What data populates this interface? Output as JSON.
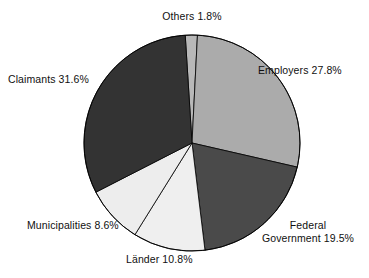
{
  "chart_data": {
    "type": "pie",
    "title": "",
    "subtitle": "",
    "xlabel": "",
    "ylabel": "",
    "legend_position": "none",
    "grid": false,
    "labels": [
      "Others",
      "Employers",
      "Federal Government",
      "Länder",
      "Municipalities",
      "Claimants"
    ],
    "values": [
      1.8,
      27.8,
      19.5,
      10.8,
      8.6,
      31.6
    ],
    "units": "percent",
    "slices": [
      {
        "name": "Others",
        "value": 1.8,
        "value_text": "1.8%",
        "label_text": "Others 1.8%",
        "color": "#b8b8b8",
        "start_angle": -3.6,
        "end_angle": 2.9
      },
      {
        "name": "Employers",
        "value": 27.8,
        "value_text": "27.8%",
        "label_text": "Employers 27.8%",
        "color": "#ababab",
        "start_angle": 2.9,
        "end_angle": 102.9
      },
      {
        "name": "Federal Government",
        "value": 19.5,
        "value_text": "19.5%",
        "label_line1": "Federal",
        "label_line2": "Government 19.5%",
        "color": "#4a4a4a",
        "start_angle": 102.9,
        "end_angle": 173.1
      },
      {
        "name": "Länder",
        "value": 10.8,
        "value_text": "10.8%",
        "label_text": "Länder 10.8%",
        "color": "#efefef",
        "start_angle": 173.1,
        "end_angle": 211.9
      },
      {
        "name": "Municipalities",
        "value": 8.6,
        "value_text": "8.6%",
        "label_text": "Municipalities 8.6%",
        "color": "#ededed",
        "start_angle": 211.9,
        "end_angle": 242.9
      },
      {
        "name": "Claimants",
        "value": 31.6,
        "value_text": "31.6%",
        "label_text": "Claimants 31.6%",
        "color": "#333333",
        "start_angle": 242.9,
        "end_angle": 356.4
      }
    ],
    "geometry": {
      "center_x": 192,
      "center_y": 143,
      "radius": 108
    },
    "style": {
      "background": "#ffffff",
      "outline_color": "#000000",
      "outline_width": 0.8,
      "text_color": "#101010"
    }
  }
}
